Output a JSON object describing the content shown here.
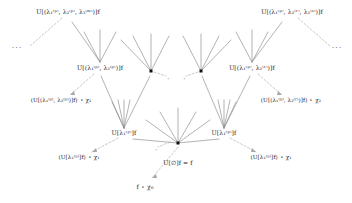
{
  "figure": {
    "background_color": "#ffffff",
    "edge_color": "#8a8a8a",
    "dashed_edge_color": "#a8a8a8",
    "node_color": "#101010",
    "text_color": "#1e1e1e",
    "width": 352,
    "height": 203
  },
  "labels": {
    "top_left": "U[(λ₁⁽ᵖ⁾, λ₂⁽ᵖ⁾, λ₃⁽ᵐ⁾)]f",
    "top_right": "U[(λ₁⁽ᵖ⁾, λ₂⁽ʳ⁾, λ₃⁽ˢ⁾)]f",
    "mid_left": "U[(λ₁⁽ᵖ⁾, λ₂⁽ᵖ⁾)]f",
    "mid_right": "U[(λ₁⁽ᵖ⁾, λ₂⁽ʳ⁾)]f",
    "out_mid_left": "(U[(λ₁⁽ᵖ⁾, λ₂⁽ᵖ⁾)]f) ⋆ χ₂",
    "out_mid_right": "(U[(λ₁⁽ᵖ⁾, λ₂⁽ʳ⁾)]f) ⋆ χ₂",
    "low_left": "U[λ₁⁽ᵖ⁾]f",
    "low_right": "U[λ₁⁽ᵖ⁾]f",
    "out_low_left": "(U[λ₁⁽ᵖ⁾]f) ⋆ χ₁",
    "out_low_right": "(U[λ₁⁽ᵖ⁾]f) ⋆ χ₁",
    "root": "U[∅]f = f",
    "root_output": "f ⋆ χ₀",
    "ellipsis_left": "···",
    "ellipsis_right": "···",
    "star_marks": [
      "⋆",
      "⋆",
      "⋆",
      "⋆",
      "⋆",
      "⋆",
      "⋆"
    ]
  },
  "nodes": [
    {
      "name": "root-node",
      "x": 178,
      "y": 143,
      "kind": "dot"
    },
    {
      "name": "low-left-node",
      "x": 124,
      "y": 133,
      "kind": "text"
    },
    {
      "name": "low-right-node",
      "x": 224,
      "y": 133,
      "kind": "text"
    },
    {
      "name": "mid-left-node",
      "x": 100,
      "y": 68,
      "kind": "text"
    },
    {
      "name": "mid-right-node",
      "x": 252,
      "y": 68,
      "kind": "text"
    },
    {
      "name": "inner-left-dot",
      "x": 151,
      "y": 71,
      "kind": "dot"
    },
    {
      "name": "inner-right-dot",
      "x": 201,
      "y": 71,
      "kind": "dot"
    },
    {
      "name": "top-left-node",
      "x": 68,
      "y": 12,
      "kind": "text"
    },
    {
      "name": "top-right-node",
      "x": 292,
      "y": 12,
      "kind": "text"
    }
  ]
}
